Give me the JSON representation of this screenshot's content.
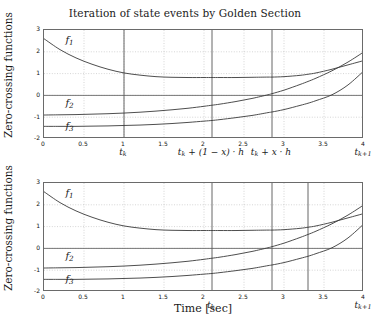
{
  "figure": {
    "width": 370,
    "height": 323,
    "background": "#ffffff",
    "axis_color": "#6a6a6a",
    "curve_color": "#3a3a3a",
    "grid_color": "#b9b9b9",
    "event_line_color": "#555555"
  },
  "panels": [
    {
      "id": "top-panel",
      "title": "Iteration of state events by Golden Section",
      "ylabel": "Zero-crossing functions",
      "xlabel": "",
      "yticks": [
        "3",
        "2",
        "1",
        "0",
        "-1",
        "-2"
      ],
      "ytick_values": [
        3,
        2,
        1,
        0,
        -1,
        -2
      ],
      "xticks": [
        "0",
        "0.5",
        "1",
        "1.5",
        "2",
        "2.5",
        "3",
        "3.5",
        "4"
      ],
      "xtick_values": [
        0,
        0.5,
        1,
        1.5,
        2,
        2.5,
        3,
        3.5,
        4
      ],
      "event_lines": [
        {
          "x": 1.0,
          "label": "t_k",
          "label_html": "t<span class='sub'>k</span>"
        },
        {
          "x": 2.1,
          "label": "t_k + (1-x)·h",
          "label_html": "t<span class='sub'>k</span> + (1 &minus; x) &middot; h"
        },
        {
          "x": 2.85,
          "label": "t_k + x·h",
          "label_html": "t<span class='sub'>k</span> + x &middot; h"
        },
        {
          "x": 4.0,
          "label": "t_k+1",
          "label_html": "t<span class='sub'>k+1</span>"
        }
      ],
      "curve_labels": [
        {
          "name": "f1",
          "label_html": "f<span class='sub'>1</span>",
          "x": 0.28,
          "y": 2.45
        },
        {
          "name": "f2",
          "label_html": "f<span class='sub'>2</span>",
          "x": 0.28,
          "y": -0.45
        },
        {
          "name": "f3",
          "label_html": "f<span class='sub'>3</span>",
          "x": 0.28,
          "y": -1.48
        }
      ]
    },
    {
      "id": "bottom-panel",
      "title": "",
      "ylabel": "Zero-crossing functions",
      "xlabel": "Time [sec]",
      "yticks": [
        "3",
        "2",
        "1",
        "0",
        "-1",
        "-2"
      ],
      "ytick_values": [
        3,
        2,
        1,
        0,
        -1,
        -2
      ],
      "xticks": [
        "0",
        "0.5",
        "1",
        "1.5",
        "2",
        "2.5",
        "3",
        "3.5",
        "4"
      ],
      "xtick_values": [
        0,
        0.5,
        1,
        1.5,
        2,
        2.5,
        3,
        3.5,
        4
      ],
      "event_lines": [
        {
          "x": 2.1,
          "label": "t_k",
          "label_html": "t<span class='sub'>k</span>"
        },
        {
          "x": 2.85,
          "label": "",
          "label_html": ""
        },
        {
          "x": 3.3,
          "label": "",
          "label_html": ""
        },
        {
          "x": 4.0,
          "label": "t_k+1",
          "label_html": "t<span class='sub'>k+1</span>"
        }
      ],
      "curve_labels": [
        {
          "name": "f1",
          "label_html": "f<span class='sub'>1</span>",
          "x": 0.28,
          "y": 2.45
        },
        {
          "name": "f2",
          "label_html": "f<span class='sub'>2</span>",
          "x": 0.28,
          "y": -0.45
        },
        {
          "name": "f3",
          "label_html": "f<span class='sub'>3</span>",
          "x": 0.28,
          "y": -1.48
        }
      ]
    }
  ],
  "chart_data": {
    "type": "line",
    "title": "Iteration of state events by Golden Section",
    "xlabel": "Time [sec]",
    "ylabel": "Zero-crossing functions",
    "xlim": [
      0,
      4
    ],
    "ylim": [
      -2,
      3
    ],
    "grid": true,
    "legend": "inline-curve-labels",
    "x": [
      0,
      0.2,
      0.4,
      0.6,
      0.8,
      1.0,
      1.2,
      1.4,
      1.6,
      1.8,
      2.0,
      2.1,
      2.2,
      2.4,
      2.6,
      2.8,
      2.85,
      3.0,
      3.2,
      3.3,
      3.4,
      3.6,
      3.8,
      4.0
    ],
    "series": [
      {
        "name": "f1",
        "values": [
          2.6,
          2.1,
          1.72,
          1.43,
          1.2,
          1.03,
          0.93,
          0.86,
          0.83,
          0.82,
          0.82,
          0.82,
          0.82,
          0.82,
          0.83,
          0.84,
          0.84,
          0.86,
          0.92,
          0.97,
          1.03,
          1.2,
          1.4,
          1.6
        ]
      },
      {
        "name": "f2",
        "values": [
          -0.9,
          -0.89,
          -0.88,
          -0.86,
          -0.84,
          -0.81,
          -0.77,
          -0.72,
          -0.66,
          -0.59,
          -0.5,
          -0.45,
          -0.4,
          -0.28,
          -0.14,
          0.03,
          0.08,
          0.24,
          0.5,
          0.64,
          0.79,
          1.13,
          1.53,
          2.0
        ]
      },
      {
        "name": "f3",
        "values": [
          -1.42,
          -1.42,
          -1.42,
          -1.41,
          -1.4,
          -1.38,
          -1.36,
          -1.33,
          -1.29,
          -1.24,
          -1.18,
          -1.15,
          -1.11,
          -1.02,
          -0.92,
          -0.79,
          -0.76,
          -0.65,
          -0.46,
          -0.36,
          -0.24,
          0.03,
          0.48,
          1.13
        ]
      }
    ],
    "panels": [
      {
        "name": "top",
        "event_markers": [
          {
            "x": 1.0,
            "label": "t_k"
          },
          {
            "x": 2.1,
            "label": "t_k + (1-x)*h"
          },
          {
            "x": 2.85,
            "label": "t_k + x*h"
          },
          {
            "x": 4.0,
            "label": "t_k+1"
          }
        ]
      },
      {
        "name": "bottom",
        "event_markers": [
          {
            "x": 2.1,
            "label": "t_k"
          },
          {
            "x": 2.85,
            "label": ""
          },
          {
            "x": 3.3,
            "label": ""
          },
          {
            "x": 4.0,
            "label": "t_k+1"
          }
        ]
      }
    ]
  }
}
